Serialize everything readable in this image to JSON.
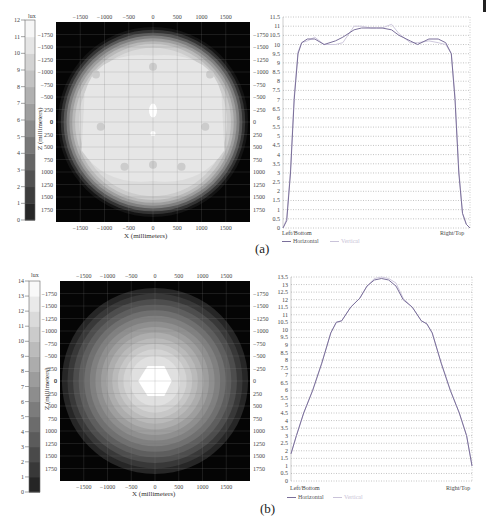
{
  "chart_data": [
    {
      "id": "a",
      "panel_label": "(a)",
      "type": "heatmap",
      "colorbar": {
        "unit": "lux",
        "min": 0,
        "max": 12,
        "ticks": [
          0,
          1,
          2,
          3,
          4,
          5,
          6,
          7,
          8,
          9,
          10,
          11,
          12
        ]
      },
      "xlabel": "X (millimeters)",
      "ylabel": "Z (millimeters)",
      "x_ticks": [
        -1500,
        -1000,
        -500,
        0,
        500,
        1000,
        1500
      ],
      "y_ticks": [
        -1750,
        -1500,
        -1250,
        -1000,
        -750,
        -500,
        -250,
        0,
        250,
        500,
        750,
        1000,
        1250,
        1500,
        1750
      ],
      "description": "Circular illuminance pattern, broad flat plateau ~10-11 lux, falling to 0 at edges",
      "center_value": 11,
      "plateau_value": 10,
      "edge_value": 0
    },
    {
      "id": "a-profile",
      "type": "line",
      "ylim": [
        0,
        11.5
      ],
      "y_ticks": [
        0,
        0.5,
        1,
        1.5,
        2,
        2.5,
        3,
        3.5,
        4,
        4.5,
        5,
        5.5,
        6,
        6.5,
        7,
        7.5,
        8,
        8.5,
        9,
        9.5,
        10,
        10.5,
        11,
        11.5
      ],
      "x_labels": {
        "left": "Left/Bottom",
        "right": "Right/Top"
      },
      "legend": [
        "Horizontal",
        "Vertical"
      ],
      "grid": true,
      "x": [
        0,
        0.02,
        0.04,
        0.06,
        0.08,
        0.1,
        0.13,
        0.17,
        0.22,
        0.28,
        0.32,
        0.38,
        0.42,
        0.47,
        0.5,
        0.53,
        0.58,
        0.62,
        0.68,
        0.72,
        0.78,
        0.83,
        0.87,
        0.9,
        0.92,
        0.94,
        0.96,
        0.98,
        1
      ],
      "series": [
        {
          "name": "Horizontal",
          "color": "#7a6f9a",
          "values": [
            0,
            0.4,
            3,
            7,
            9.5,
            10.1,
            10.3,
            10.3,
            10,
            10.2,
            10.4,
            10.8,
            10.9,
            10.9,
            10.9,
            10.9,
            10.8,
            10.5,
            10.2,
            10,
            10.3,
            10.3,
            10.1,
            9.5,
            7,
            3,
            0.8,
            0.2,
            0
          ]
        },
        {
          "name": "Vertical",
          "color": "#c9c3d9",
          "values": [
            0,
            0.5,
            3.2,
            7.2,
            9.6,
            10.1,
            10.2,
            10.4,
            10,
            10,
            10.1,
            11,
            11,
            10.9,
            10.9,
            10.9,
            11.1,
            10.6,
            10.1,
            10.1,
            10.2,
            10.1,
            10,
            9.5,
            7.2,
            3.2,
            0.8,
            0.2,
            0
          ]
        }
      ]
    },
    {
      "id": "b",
      "panel_label": "(b)",
      "type": "heatmap",
      "colorbar": {
        "unit": "lux",
        "min": 0,
        "max": 14,
        "ticks": [
          0,
          1,
          2,
          3,
          4,
          5,
          6,
          7,
          8,
          9,
          10,
          11,
          12,
          13,
          14
        ]
      },
      "xlabel": "X (millimeters)",
      "ylabel": "Z (millimeters)",
      "x_ticks": [
        -1500,
        -1000,
        -500,
        0,
        500,
        1000,
        1500
      ],
      "y_ticks": [
        -1750,
        -1500,
        -1250,
        -1000,
        -750,
        -500,
        -250,
        0,
        250,
        500,
        750,
        1000,
        1250,
        1500,
        1750
      ],
      "description": "Circular illuminance pattern peaking ~13.5 lux at center, concentric rings decreasing outward",
      "center_value": 13.5,
      "edge_value": 1
    },
    {
      "id": "b-profile",
      "type": "line",
      "ylim": [
        0,
        13.5
      ],
      "y_ticks": [
        0,
        0.5,
        1,
        1.5,
        2,
        2.5,
        3,
        3.5,
        4,
        4.5,
        5,
        5.5,
        6,
        6.5,
        7,
        7.5,
        8,
        8.5,
        9,
        9.5,
        10,
        10.5,
        11,
        11.5,
        12,
        12.5,
        13,
        13.5
      ],
      "x_labels": {
        "left": "Left/Bottom",
        "right": "Right/Top"
      },
      "legend": [
        "Horizontal",
        "Vertical"
      ],
      "grid": true,
      "x": [
        0,
        0.03,
        0.07,
        0.12,
        0.17,
        0.22,
        0.25,
        0.28,
        0.33,
        0.38,
        0.42,
        0.46,
        0.5,
        0.54,
        0.58,
        0.62,
        0.67,
        0.72,
        0.75,
        0.78,
        0.83,
        0.88,
        0.93,
        0.97,
        1
      ],
      "series": [
        {
          "name": "Horizontal",
          "color": "#7a6f9a",
          "values": [
            1.8,
            3,
            4.5,
            6,
            7.8,
            9.8,
            10.5,
            10.6,
            11.5,
            12.1,
            12.9,
            13.3,
            13.4,
            13.3,
            12.9,
            12,
            11.5,
            10.6,
            10.4,
            9.8,
            7.8,
            6,
            4.5,
            3,
            1
          ]
        },
        {
          "name": "Vertical",
          "color": "#c9c3d9",
          "values": [
            1.8,
            3,
            4.5,
            6,
            7.8,
            9.8,
            10.5,
            10.6,
            11.5,
            12.1,
            12.9,
            13.4,
            13.5,
            13.4,
            13.1,
            12.1,
            11.5,
            10.6,
            10.4,
            9.8,
            7.8,
            6,
            4.5,
            3,
            1
          ]
        }
      ]
    }
  ],
  "labels": {
    "lux": "lux",
    "xlabel": "X (millimeters)",
    "ylabel": "Z (millimeters)",
    "left": "Left/Bottom",
    "right": "Right/Top",
    "legend_h": "Horizontal",
    "legend_v": "Vertical",
    "cap_a": "(a)",
    "cap_b": "(b)"
  }
}
